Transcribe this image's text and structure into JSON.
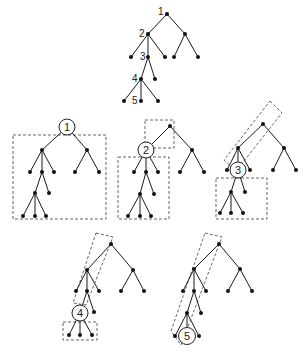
{
  "diagram": {
    "top_tree": {
      "labels": [
        "1",
        "2",
        "3",
        "4",
        "5"
      ]
    },
    "panels": [
      {
        "id": "panel-1",
        "circled_label": "1"
      },
      {
        "id": "panel-2",
        "circled_label": "2"
      },
      {
        "id": "panel-3",
        "circled_label": "3"
      },
      {
        "id": "panel-4",
        "circled_label": "4"
      },
      {
        "id": "panel-5",
        "circled_label": "5"
      }
    ],
    "colors": {
      "edge": "#1a1a1a",
      "node": "#111111",
      "dashed": "#555555",
      "background": "#ffffff"
    }
  }
}
